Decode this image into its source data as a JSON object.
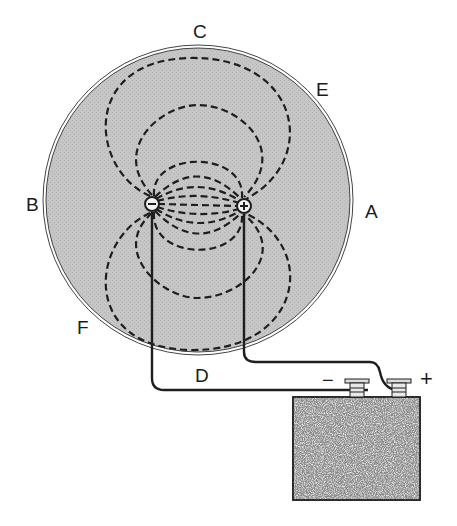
{
  "diagram": {
    "type": "electric field / current flow in conducting disc",
    "colors": {
      "disc_fill": "#c4c4c4",
      "line": "#1e1e1e",
      "battery_fill": "#8a8a8a",
      "background": "#ffffff"
    },
    "disc": {
      "cx": 198,
      "cy": 200,
      "r": 154
    },
    "electrodes": {
      "negative": {
        "symbol": "−",
        "cx": 152,
        "cy": 204
      },
      "positive": {
        "symbol": "+",
        "cx": 244,
        "cy": 206
      }
    },
    "labels": {
      "A": "A",
      "B": "B",
      "C": "C",
      "D": "D",
      "E": "E",
      "F": "F"
    },
    "battery": {
      "negative_terminal_label": "−",
      "positive_terminal_label": "+"
    }
  }
}
